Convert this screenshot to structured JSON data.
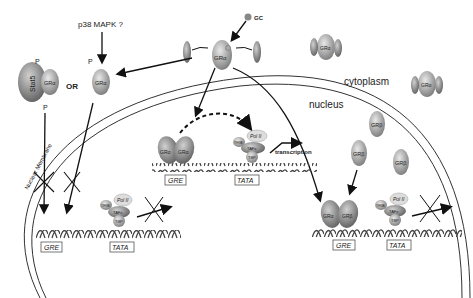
{
  "labels": {
    "gc": "GC",
    "p38": "p38 MAPK ?",
    "or": "OR",
    "cytoplasm": "cytoplasm",
    "nucleus": "nucleus",
    "nuclear_membrane": "Nuclear Membrane",
    "transcription": "transcription",
    "phospho": "P",
    "stat5": "Stat5",
    "gr_alpha": "GRα",
    "gr_beta": "GRβ",
    "hsp": "hsp",
    "pol2": "Pol II",
    "tfiib": "TFIIB",
    "tafs": "TAFs",
    "tbp": "TBP",
    "gre": "GRE",
    "tata": "TATA"
  },
  "colors": {
    "protein": "#9a9a9a",
    "protein_light": "#c8c8c8",
    "line": "#111111",
    "membrane": "#333333"
  }
}
